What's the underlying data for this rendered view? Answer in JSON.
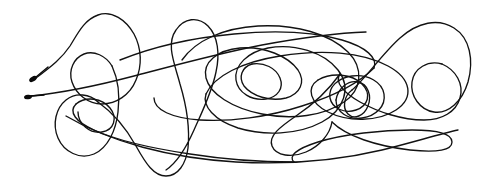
{
  "artwork": {
    "title": "Continuous line scribble drawing",
    "medium": "pen on paper",
    "stroke_count": 1,
    "width": 487,
    "height": 188,
    "background_color": "#ffffff",
    "ink_color": "#121212",
    "stroke_width": 1.35,
    "description": "A single unbroken looping pen stroke forming overlapping ellipses, arches and knots across a horizontal band"
  },
  "endpoints": [
    {
      "name": "stroke-start-blob",
      "x": 33,
      "y": 79,
      "rx": 4.2,
      "ry": 2.4,
      "rotation": -32,
      "tail": "M 36 77 L 48 67"
    },
    {
      "name": "stroke-end-blob",
      "x": 28,
      "y": 97,
      "rx": 4.0,
      "ry": 2.3,
      "rotation": -6,
      "tail": "M 31 96 L 44 95"
    }
  ],
  "stroke_paths": [
    {
      "name": "segment-left-rise-and-big-arch",
      "d": "M 36 78 C 52 66 62 58 70 46 C 78 33 84 20 98 15 C 112 10 126 20 134 34 C 142 49 142 66 136 80 C 130 95 116 104 102 104 C 88 104 76 94 72 82 C 68 70 74 58 84 54 C 94 50 106 56 112 66"
    },
    {
      "name": "segment-left-descender-loop",
      "d": "M 112 66 C 118 79 120 96 118 112 C 116 130 108 148 94 154 C 80 160 64 152 58 138 C 52 124 56 108 66 100 C 76 92 90 94 98 102"
    },
    {
      "name": "segment-long-diagonal-to-right",
      "d": "M 31 96 C 60 93 96 86 134 76 C 176 65 220 53 262 45 C 300 38 336 33 366 32"
    },
    {
      "name": "segment-left-sweep-lower",
      "d": "M 98 102 C 112 112 126 128 136 146 C 146 164 154 176 166 176 C 178 176 186 164 188 148 C 190 128 186 104 180 84 C 174 62 166 44 176 30 C 184 18 198 16 208 26 C 218 36 220 54 216 72 C 212 92 202 112 194 130 C 186 148 178 162 166 170"
    },
    {
      "name": "segment-bottom-long-horizontal",
      "d": "M 66 116 C 110 142 170 158 236 162 C 290 165 340 160 382 150 C 414 142 440 134 458 130"
    },
    {
      "name": "segment-mid-outer-ellipse",
      "d": "M 182 60 C 196 40 224 28 258 26 C 296 24 330 34 348 52 C 364 68 362 90 344 102 C 324 116 292 120 262 114 C 232 108 210 94 206 78 C 202 62 218 50 240 48 C 264 46 288 56 298 70 C 306 82 300 94 286 98 C 270 102 252 96 244 86 C 238 77 242 67 252 64"
    },
    {
      "name": "segment-central-spiral-out",
      "d": "M 252 64 C 264 62 276 68 280 78 C 284 88 278 97 266 99 C 252 101 238 93 236 80 C 234 65 248 52 268 48 C 294 43 324 52 338 70 C 352 88 344 110 322 122 C 298 135 264 136 238 128 C 214 120 202 106 206 94"
    },
    {
      "name": "segment-right-upper-arc",
      "d": "M 206 94 C 214 76 242 62 280 56 C 322 49 362 52 388 66 C 412 79 414 98 396 110 C 378 122 348 122 328 112 C 310 103 306 88 318 80"
    },
    {
      "name": "segment-right-knot-loop",
      "d": "M 318 80 C 332 72 352 74 362 84 C 372 94 368 106 356 110 C 344 114 332 108 330 98 C 328 87 338 78 352 76 C 368 74 382 82 384 94 C 386 106 376 116 362 118 C 348 120 336 112 336 100"
    },
    {
      "name": "segment-tiny-inner-loop",
      "d": "M 336 100 C 338 88 348 80 358 82 C 368 84 372 96 368 106 C 364 116 354 120 348 114 C 342 108 344 96 352 90"
    },
    {
      "name": "segment-far-right-big-loop",
      "d": "M 352 90 C 366 78 382 54 400 38 C 418 22 438 18 454 28 C 470 38 474 60 468 82 C 462 102 448 114 434 112 C 420 110 410 96 412 82 C 414 68 428 60 442 64"
    },
    {
      "name": "segment-right-return-sweep",
      "d": "M 442 64 C 456 70 464 84 460 98 C 456 112 442 120 424 120 C 402 120 378 112 360 102 C 344 93 334 82 340 74"
    },
    {
      "name": "segment-lower-right-diagonal",
      "d": "M 340 74 C 330 88 314 104 296 116 C 280 127 268 136 272 146 C 276 156 292 158 306 152 C 320 146 330 134 332 122"
    },
    {
      "name": "segment-flat-bottom-loop",
      "d": "M 332 122 C 346 136 376 146 410 150 C 438 153 452 150 452 142 C 452 134 438 130 412 130 C 382 130 344 134 318 142 C 296 149 288 156 294 162"
    },
    {
      "name": "segment-return-left-bottom",
      "d": "M 294 162 C 268 162 228 160 190 154 C 150 148 116 140 94 130 C 76 122 68 112 76 104"
    },
    {
      "name": "segment-left-small-oval",
      "d": "M 76 104 C 86 96 102 98 110 108 C 118 118 114 130 102 132 C 90 134 78 124 78 112"
    },
    {
      "name": "segment-upper-mid-connector",
      "d": "M 120 60 C 150 48 190 38 234 34 C 276 30 314 32 342 40 C 366 47 378 58 374 68"
    },
    {
      "name": "segment-mid-low-crossing",
      "d": "M 374 68 C 360 82 334 96 302 106 C 268 117 230 122 200 120 C 172 118 154 110 154 98"
    }
  ]
}
